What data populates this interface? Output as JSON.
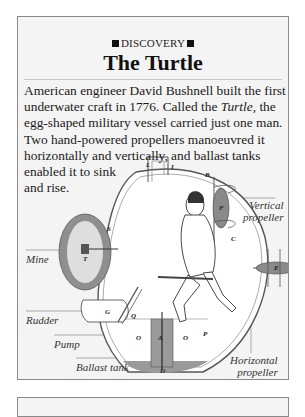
{
  "article": {
    "kicker": "DISCOVERY",
    "kicker_icon": "black-square",
    "title": "The Turtle",
    "body_lines": [
      {
        "pre": "American engineer David Bushnell built the first",
        "em": "",
        "post": ""
      },
      {
        "pre": "underwater craft in 1776. Called the ",
        "em": "Turtle",
        "post": ", the"
      },
      {
        "pre": "egg-shaped military vessel carried just one man.",
        "em": "",
        "post": ""
      },
      {
        "pre": "Two hand-powered propellers manoeuvred it",
        "em": "",
        "post": ""
      },
      {
        "pre": "horizontally and vertically, and ballast tanks",
        "em": "",
        "post": ""
      },
      {
        "pre": "enabled it to sink",
        "em": "",
        "post": ""
      },
      {
        "pre": "and rise.",
        "em": "",
        "post": ""
      }
    ]
  },
  "diagram": {
    "labels": {
      "mine": "Mine",
      "rudder": "Rudder",
      "pump": "Pump",
      "ballast_tank": "Ballast tank",
      "vertical_propeller_1": "Vertical",
      "vertical_propeller_2": "propeller",
      "horizontal_propeller_1": "Horizontal",
      "horizontal_propeller_2": "propeller"
    },
    "letters": [
      "L",
      "I",
      "B",
      "F",
      "S",
      "T",
      "G",
      "Q",
      "O",
      "A",
      "O",
      "P",
      "D",
      "E",
      "C"
    ],
    "colors": {
      "hull": "#ffffff",
      "hull_stroke": "#555555",
      "mine_outer": "#8f8f8f",
      "mine_inner": "#d9d9d9",
      "tank": "#9a9a9a",
      "propeller": "#8a8a8a"
    }
  }
}
